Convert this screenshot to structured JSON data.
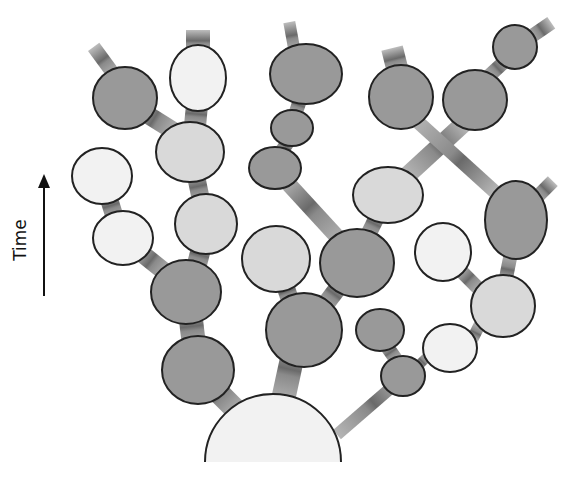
{
  "axis": {
    "label": "Time",
    "direction": "up",
    "arrow": {
      "x": 44,
      "y1": 296,
      "y2": 174
    }
  },
  "colors": {
    "dark": "#999999",
    "light": "#d9d9d9",
    "white": "#f2f2f2",
    "stroke": "#222222",
    "edge": "#a8a8a8",
    "edge_band": "#6a6a6a"
  },
  "root": {
    "cx": 273,
    "cy": 462,
    "r": 68,
    "shade": "white"
  },
  "nodes": [
    {
      "id": "n1",
      "cx": 198,
      "cy": 370,
      "rx": 36,
      "ry": 34,
      "shade": "dark"
    },
    {
      "id": "n2",
      "cx": 186,
      "cy": 292,
      "rx": 35,
      "ry": 32,
      "shade": "dark"
    },
    {
      "id": "n3",
      "cx": 206,
      "cy": 224,
      "rx": 31,
      "ry": 30,
      "shade": "light"
    },
    {
      "id": "n4",
      "cx": 190,
      "cy": 152,
      "rx": 34,
      "ry": 30,
      "shade": "light"
    },
    {
      "id": "n5",
      "cx": 198,
      "cy": 78,
      "rx": 28,
      "ry": 33,
      "shade": "white"
    },
    {
      "id": "n6",
      "cx": 125,
      "cy": 98,
      "rx": 32,
      "ry": 31,
      "shade": "dark"
    },
    {
      "id": "n7",
      "cx": 123,
      "cy": 238,
      "rx": 30,
      "ry": 27,
      "shade": "white"
    },
    {
      "id": "n8",
      "cx": 102,
      "cy": 176,
      "rx": 30,
      "ry": 28,
      "shade": "white"
    },
    {
      "id": "n9",
      "cx": 304,
      "cy": 330,
      "rx": 38,
      "ry": 37,
      "shade": "dark"
    },
    {
      "id": "n10",
      "cx": 276,
      "cy": 259,
      "rx": 34,
      "ry": 33,
      "shade": "light"
    },
    {
      "id": "n11",
      "cx": 357,
      "cy": 263,
      "rx": 37,
      "ry": 34,
      "shade": "dark"
    },
    {
      "id": "n12",
      "cx": 388,
      "cy": 195,
      "rx": 35,
      "ry": 28,
      "shade": "light"
    },
    {
      "id": "n13",
      "cx": 275,
      "cy": 168,
      "rx": 26,
      "ry": 21,
      "shade": "dark"
    },
    {
      "id": "n14",
      "cx": 292,
      "cy": 128,
      "rx": 21,
      "ry": 18,
      "shade": "dark"
    },
    {
      "id": "n15",
      "cx": 306,
      "cy": 74,
      "rx": 36,
      "ry": 30,
      "shade": "dark"
    },
    {
      "id": "n16",
      "cx": 401,
      "cy": 97,
      "rx": 32,
      "ry": 32,
      "shade": "dark"
    },
    {
      "id": "n17",
      "cx": 475,
      "cy": 100,
      "rx": 32,
      "ry": 30,
      "shade": "dark"
    },
    {
      "id": "n18",
      "cx": 515,
      "cy": 47,
      "rx": 22,
      "ry": 22,
      "shade": "dark"
    },
    {
      "id": "n19",
      "cx": 516,
      "cy": 220,
      "rx": 31,
      "ry": 39,
      "shade": "dark"
    },
    {
      "id": "n20",
      "cx": 503,
      "cy": 306,
      "rx": 32,
      "ry": 31,
      "shade": "light"
    },
    {
      "id": "n21",
      "cx": 443,
      "cy": 252,
      "rx": 28,
      "ry": 29,
      "shade": "white"
    },
    {
      "id": "n22",
      "cx": 450,
      "cy": 348,
      "rx": 27,
      "ry": 24,
      "shade": "white"
    },
    {
      "id": "n23",
      "cx": 403,
      "cy": 376,
      "rx": 22,
      "ry": 20,
      "shade": "dark"
    },
    {
      "id": "n24",
      "cx": 380,
      "cy": 330,
      "rx": 24,
      "ry": 21,
      "shade": "dark"
    }
  ],
  "edges": [
    {
      "from": "root",
      "to": "n1",
      "x1": 236,
      "y1": 410,
      "x2": 206,
      "y2": 380,
      "w": 22
    },
    {
      "from": "root",
      "to": "n9",
      "x1": 283,
      "y1": 400,
      "x2": 295,
      "y2": 345,
      "w": 24
    },
    {
      "from": "root",
      "to": "n23",
      "x1": 340,
      "y1": 432,
      "x2": 400,
      "y2": 380,
      "w": 12
    },
    {
      "from": "n1",
      "to": "n2",
      "x1": 194,
      "y1": 345,
      "x2": 190,
      "y2": 312,
      "w": 24
    },
    {
      "from": "n2",
      "to": "n3",
      "x1": 196,
      "y1": 268,
      "x2": 202,
      "y2": 245,
      "w": 20
    },
    {
      "from": "n2",
      "to": "n7",
      "x1": 165,
      "y1": 272,
      "x2": 140,
      "y2": 252,
      "w": 18
    },
    {
      "from": "n7",
      "to": "n8",
      "x1": 115,
      "y1": 218,
      "x2": 108,
      "y2": 196,
      "w": 18
    },
    {
      "from": "n3",
      "to": "n4",
      "x1": 201,
      "y1": 200,
      "x2": 196,
      "y2": 176,
      "w": 18
    },
    {
      "from": "n4",
      "to": "n5",
      "x1": 195,
      "y1": 126,
      "x2": 197,
      "y2": 105,
      "w": 22
    },
    {
      "from": "n4",
      "to": "n6",
      "x1": 172,
      "y1": 130,
      "x2": 140,
      "y2": 110,
      "w": 18
    },
    {
      "from": "n6",
      "to": "tip1",
      "x1": 112,
      "y1": 72,
      "x2": 96,
      "y2": 50,
      "w": 14
    },
    {
      "from": "n5",
      "to": "tip2",
      "x1": 198,
      "y1": 50,
      "x2": 198,
      "y2": 34,
      "w": 24
    },
    {
      "from": "n9",
      "to": "n10",
      "x1": 290,
      "y1": 300,
      "x2": 285,
      "y2": 285,
      "w": 18
    },
    {
      "from": "n9",
      "to": "n11",
      "x1": 325,
      "y1": 305,
      "x2": 340,
      "y2": 285,
      "w": 18
    },
    {
      "from": "n11",
      "to": "n13",
      "x1": 340,
      "y1": 240,
      "x2": 285,
      "y2": 180,
      "w": 16
    },
    {
      "from": "n11",
      "to": "n12",
      "x1": 368,
      "y1": 235,
      "x2": 378,
      "y2": 215,
      "w": 16
    },
    {
      "from": "n13",
      "to": "n14",
      "x1": 281,
      "y1": 152,
      "x2": 288,
      "y2": 142,
      "w": 14
    },
    {
      "from": "n14",
      "to": "n15",
      "x1": 296,
      "y1": 112,
      "x2": 300,
      "y2": 100,
      "w": 14
    },
    {
      "from": "n15",
      "to": "tip3",
      "x1": 294,
      "y1": 48,
      "x2": 290,
      "y2": 26,
      "w": 12
    },
    {
      "from": "n12",
      "to": "n17",
      "x1": 410,
      "y1": 173,
      "x2": 462,
      "y2": 125,
      "w": 18
    },
    {
      "from": "n16",
      "to": "n19",
      "x1": 418,
      "y1": 122,
      "x2": 495,
      "y2": 192,
      "w": 14
    },
    {
      "from": "n16",
      "to": "tip4",
      "x1": 397,
      "y1": 68,
      "x2": 393,
      "y2": 52,
      "w": 22
    },
    {
      "from": "n17",
      "to": "n18",
      "x1": 490,
      "y1": 75,
      "x2": 503,
      "y2": 63,
      "w": 14
    },
    {
      "from": "n18",
      "to": "tip5",
      "x1": 532,
      "y1": 36,
      "x2": 548,
      "y2": 25,
      "w": 14
    },
    {
      "from": "n19",
      "to": "tip6",
      "x1": 538,
      "y1": 196,
      "x2": 550,
      "y2": 184,
      "w": 14
    },
    {
      "from": "n19",
      "to": "n20",
      "x1": 510,
      "y1": 258,
      "x2": 506,
      "y2": 278,
      "w": 14
    },
    {
      "from": "n20",
      "to": "n21",
      "x1": 478,
      "y1": 288,
      "x2": 462,
      "y2": 272,
      "w": 14
    },
    {
      "from": "n20",
      "to": "n22",
      "x1": 478,
      "y1": 328,
      "x2": 474,
      "y2": 336,
      "w": 12
    },
    {
      "from": "n22",
      "to": "n23",
      "x1": 426,
      "y1": 358,
      "x2": 420,
      "y2": 364,
      "w": 10
    },
    {
      "from": "n23",
      "to": "n24",
      "x1": 395,
      "y1": 358,
      "x2": 388,
      "y2": 348,
      "w": 14
    }
  ]
}
